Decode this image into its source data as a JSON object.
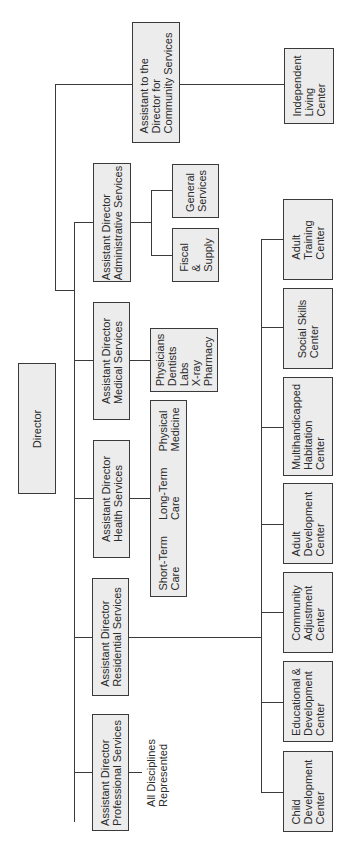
{
  "chart": {
    "director": "Director",
    "community": {
      "head": "Assistant to the\nDirector for\nCommunity Services",
      "units": [
        "Independent\nLiving\nCenter"
      ]
    },
    "administrative": {
      "head": "Assistant Director\nAdministrative Services",
      "units": [
        "General\nServices",
        "Fiscal\n&\nSupply"
      ]
    },
    "medical": {
      "head": "Assistant Director\nMedical Services",
      "units": [
        "Physicians\nDentists\nLabs\nX-ray\nPharmacy"
      ]
    },
    "health": {
      "head": "Assistant Director\nHealth Services",
      "units": [
        "Short-Term\nCare",
        "Long-Term\nCare",
        "Physical\nMedicine"
      ]
    },
    "residential": {
      "head": "Assistant Director\nResidential Services",
      "units": [
        "Adult\nTraining\nCenter",
        "Social Skills\nCenter",
        "Multihandicapped\nHabitation\nCenter",
        "Adult\nDevelopment\nCenter",
        "Community\nAdjustment\nCenter",
        "Educational &\nDevelopment\nCenter",
        "Child\nDevelopment\nCenter"
      ]
    },
    "professional": {
      "head": "Assistant Director\nProfessional Services",
      "note": "All Disciplines\nRepresented"
    }
  },
  "colors": {
    "box_fill": "#ececec",
    "line": "#3a3a3a"
  }
}
